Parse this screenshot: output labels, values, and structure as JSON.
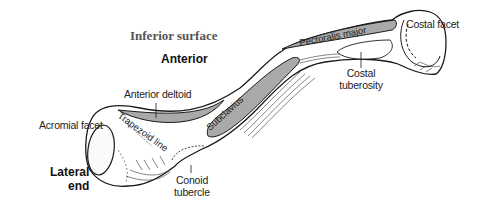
{
  "title": "Inferior surface",
  "orientation": "Anterior",
  "end_label": {
    "line1": "Lateral",
    "line2": "end"
  },
  "labels": {
    "costal_facet": "Costal facet",
    "costal_tuberosity": {
      "line1": "Costal",
      "line2": "tuberosity"
    },
    "anterior_deltoid": "Anterior deltoid",
    "acromial_facet": "Acromial facet",
    "conoid_tubercle": {
      "line1": "Conoid",
      "line2": "tubercle"
    }
  },
  "muscles": {
    "pectoralis_major": "Pectoralis major",
    "subclavius": "Subclavius",
    "trapezoid_line": "Trapezoid line"
  },
  "colors": {
    "muscle_fill": "#a9a9a9",
    "outline": "#1a1a1a",
    "background": "#ffffff"
  }
}
